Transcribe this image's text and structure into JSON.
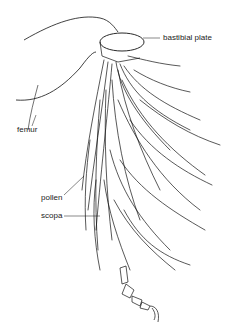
{
  "diagram": {
    "labels": {
      "bastibial_plate": "bastibial plate",
      "femur": "femur",
      "pollen": "pollen",
      "scopa": "scopa"
    },
    "colors": {
      "ink": "#111111",
      "label": "#222222",
      "background": "#ffffff"
    }
  }
}
